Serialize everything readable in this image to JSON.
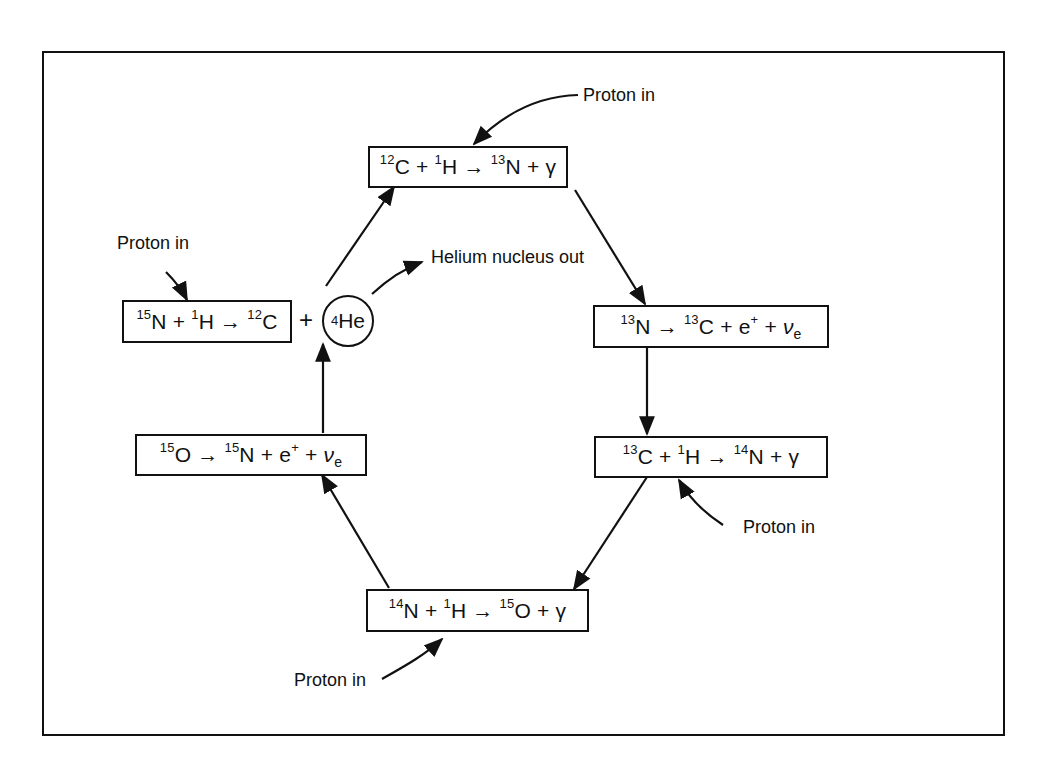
{
  "diagram": {
    "reactions": [
      {
        "id": "r1",
        "parts": [
          {
            "sup": "12"
          },
          {
            "t": "C + "
          },
          {
            "sup": "1"
          },
          {
            "t": "H → "
          },
          {
            "sup": "13"
          },
          {
            "t": "N + γ"
          }
        ]
      },
      {
        "id": "r2",
        "parts": [
          {
            "sup": "13"
          },
          {
            "t": "N → "
          },
          {
            "sup": "13"
          },
          {
            "t": "C + e"
          },
          {
            "sup": "+"
          },
          {
            "t": " + "
          },
          {
            "nu": "ν"
          },
          {
            "sub": "e"
          }
        ]
      },
      {
        "id": "r3",
        "parts": [
          {
            "sup": "13"
          },
          {
            "t": "C + "
          },
          {
            "sup": "1"
          },
          {
            "t": "H → "
          },
          {
            "sup": "14"
          },
          {
            "t": "N + γ"
          }
        ]
      },
      {
        "id": "r4",
        "parts": [
          {
            "sup": "14"
          },
          {
            "t": "N + "
          },
          {
            "sup": "1"
          },
          {
            "t": "H → "
          },
          {
            "sup": "15"
          },
          {
            "t": "O + γ"
          }
        ]
      },
      {
        "id": "r5",
        "parts": [
          {
            "sup": "15"
          },
          {
            "t": "O → "
          },
          {
            "sup": "15"
          },
          {
            "t": "N + e"
          },
          {
            "sup": "+"
          },
          {
            "t": " + "
          },
          {
            "nu": "ν"
          },
          {
            "sub": "e"
          }
        ]
      },
      {
        "id": "r6",
        "parts": [
          {
            "sup": "15"
          },
          {
            "t": "N + "
          },
          {
            "sup": "1"
          },
          {
            "t": "H → "
          },
          {
            "sup": "12"
          },
          {
            "t": "C"
          }
        ]
      }
    ],
    "helium": {
      "sup": "4",
      "symbol": "He"
    },
    "plus_sign": "+",
    "labels": {
      "proton_in_top": "Proton in",
      "proton_in_left": "Proton in",
      "proton_in_right": "Proton in",
      "proton_in_bottom": "Proton in",
      "helium_out": "Helium nucleus out"
    }
  }
}
